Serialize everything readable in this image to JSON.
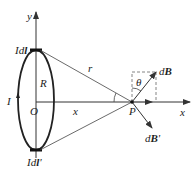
{
  "diagram": {
    "labels": {
      "y_axis": "y",
      "x_axis": "x",
      "current_element_top": "Idl",
      "current_element_bottom": "Idl'",
      "radius": "R",
      "distance_r": "r",
      "origin": "O",
      "current": "I",
      "distance_x": "x",
      "point": "P",
      "angle": "θ",
      "field_dB": "dB",
      "field_dB_prime": "dB'"
    },
    "colors": {
      "line": "#333333",
      "dashed": "#666666",
      "background": "#ffffff"
    }
  }
}
